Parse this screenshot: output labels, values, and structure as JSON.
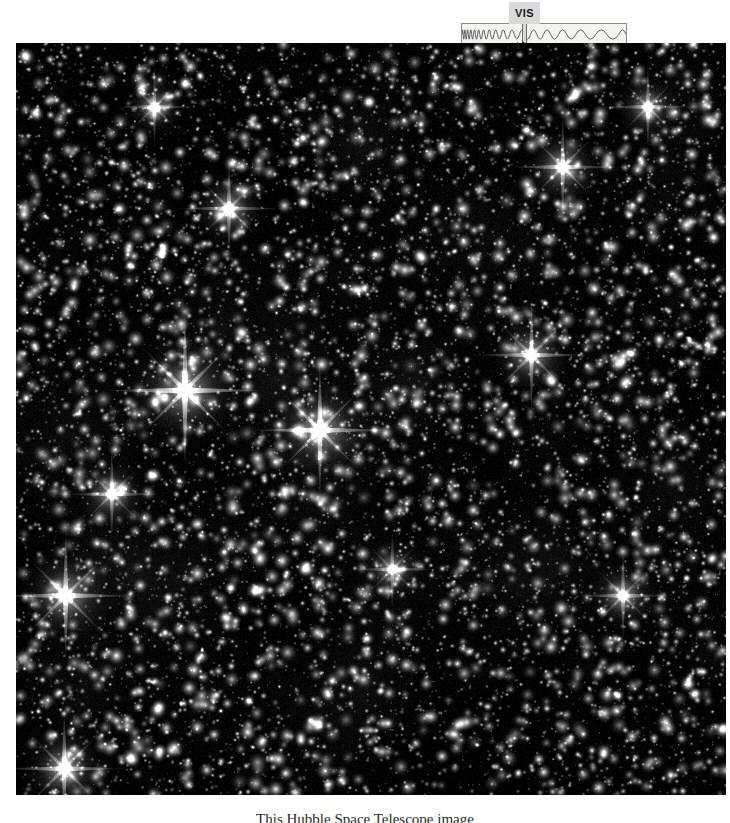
{
  "page": {
    "width": 730,
    "height": 823,
    "background_color": "#ffffff"
  },
  "spectrum_widget": {
    "name": "electromagnetic-spectrum-indicator",
    "visible_band_label": "VIS",
    "band_fill_color": "#f3f3f1",
    "band_border_color": "#8c8c8c",
    "tab_color": "#d9d9d7",
    "pointer_color": "#111111",
    "description": "Waveform strip showing short wavelengths on the left increasing to long wavelengths on the right, with a marker tab on the visible-light portion."
  },
  "starfield": {
    "name": "hubble-star-field-image",
    "background_color": "#000000",
    "star_color": "#ffffff",
    "bright_stars": [
      {
        "x": 0.238,
        "y": 0.462,
        "size": 1.0
      },
      {
        "x": 0.428,
        "y": 0.515,
        "size": 0.85
      },
      {
        "x": 0.07,
        "y": 0.735,
        "size": 0.8
      },
      {
        "x": 0.068,
        "y": 0.965,
        "size": 0.7
      },
      {
        "x": 0.726,
        "y": 0.415,
        "size": 0.65
      },
      {
        "x": 0.77,
        "y": 0.165,
        "size": 0.6
      },
      {
        "x": 0.3,
        "y": 0.22,
        "size": 0.55
      },
      {
        "x": 0.855,
        "y": 0.735,
        "size": 0.5
      },
      {
        "x": 0.135,
        "y": 0.6,
        "size": 0.5
      },
      {
        "x": 0.89,
        "y": 0.085,
        "size": 0.45
      },
      {
        "x": 0.195,
        "y": 0.085,
        "size": 0.4
      },
      {
        "x": 0.53,
        "y": 0.7,
        "size": 0.4
      }
    ],
    "star_count": 9000
  },
  "caption": {
    "name": "figure-caption",
    "text": "This Hubble Space Telescope image"
  }
}
